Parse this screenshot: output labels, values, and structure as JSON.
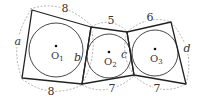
{
  "diagram": {
    "type": "geometry",
    "circles": [
      {
        "id": "O1",
        "label": "O",
        "sub": "1",
        "cx": 56,
        "cy": 50,
        "r": 27
      },
      {
        "id": "O2",
        "label": "O",
        "sub": "2",
        "cx": 109,
        "cy": 56,
        "r": 22
      },
      {
        "id": "O3",
        "label": "O",
        "sub": "3",
        "cx": 155,
        "cy": 53,
        "r": 23
      }
    ],
    "side_labels": {
      "top_1": "8",
      "bottom_1": "8",
      "top_2": "5",
      "bottom_2": "7",
      "top_3": "6",
      "bottom_3": "7",
      "a": "a",
      "b": "b",
      "c": "c",
      "d": "d"
    },
    "colors": {
      "stroke": "#222222",
      "dashed": "#9a9a9a",
      "text": "#333333"
    }
  }
}
